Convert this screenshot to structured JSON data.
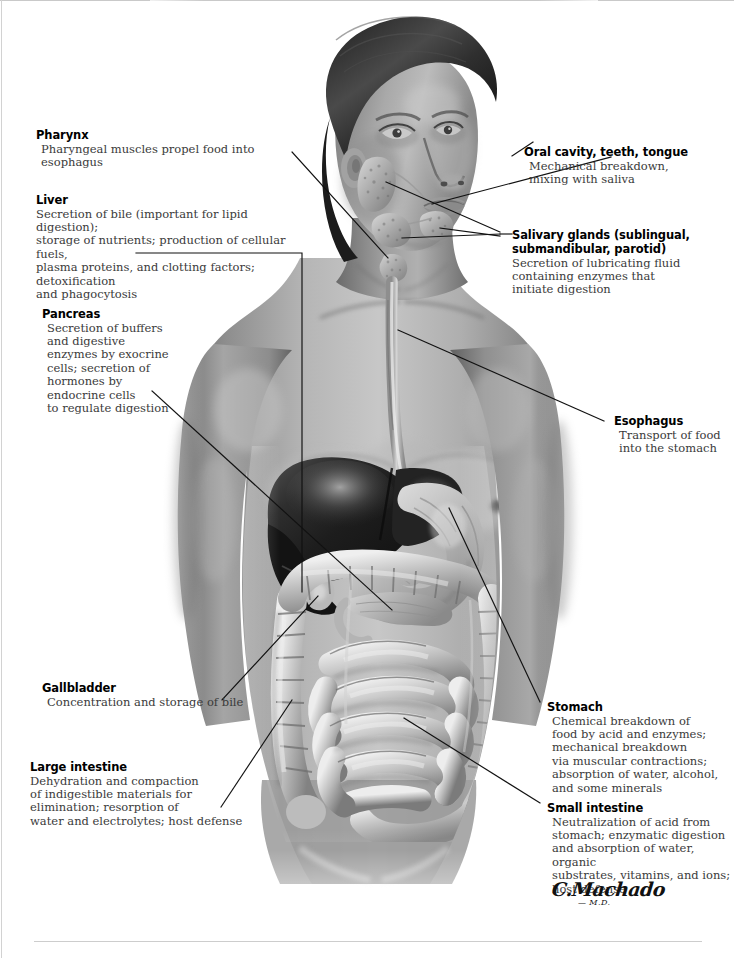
{
  "figure": {
    "style": "grayscale-medical-illustration",
    "signature_name": "C.Machado",
    "signature_credential": "— M.D."
  },
  "callouts": [
    {
      "id": "pharynx",
      "title": "Pharynx",
      "body": "Pharyngeal muscles propel food into esophagus",
      "side": "left"
    },
    {
      "id": "liver",
      "title": "Liver",
      "body": "Secretion of bile (important for lipid digestion);\nstorage of nutrients; production of cellular fuels,\nplasma proteins, and clotting factors; detoxification\nand phagocytosis",
      "side": "left"
    },
    {
      "id": "pancreas",
      "title": "Pancreas",
      "body": "Secretion of buffers\nand digestive\nenzymes by exocrine\ncells; secretion of\nhormones by\nendocrine cells\nto regulate digestion",
      "side": "left"
    },
    {
      "id": "gallbladder",
      "title": "Gallbladder",
      "body": "Concentration and storage of bile",
      "side": "left"
    },
    {
      "id": "large-intestine",
      "title": "Large intestine",
      "body": "Dehydration and compaction\nof indigestible materials for\nelimination; resorption of\nwater and electrolytes; host defense",
      "side": "left"
    },
    {
      "id": "oral-cavity",
      "title": "Oral cavity, teeth, tongue",
      "body": "Mechanical breakdown,\nmixing with saliva",
      "side": "right"
    },
    {
      "id": "salivary-glands",
      "title": "Salivary glands (sublingual,\nsubmandibular, parotid)",
      "body": "Secretion of lubricating fluid\ncontaining enzymes that\ninitiate digestion",
      "side": "right"
    },
    {
      "id": "esophagus",
      "title": "Esophagus",
      "body": "Transport of food\ninto the stomach",
      "side": "right"
    },
    {
      "id": "stomach",
      "title": "Stomach",
      "body": "Chemical breakdown of\nfood by acid and enzymes;\nmechanical breakdown\nvia muscular contractions;\nabsorption of water, alcohol,\nand some minerals",
      "side": "right"
    },
    {
      "id": "small-intestine",
      "title": "Small intestine",
      "body": "Neutralization of acid from\nstomach; enzymatic digestion\nand absorption of water, organic\nsubstrates, vitamins, and ions;\nhost defense",
      "side": "right"
    }
  ],
  "colors": {
    "page_background": "#ffffff",
    "title_text": "#000000",
    "body_text": "#3a3a3a",
    "leader_line": "#111111",
    "rule": "#cdcdcd"
  }
}
